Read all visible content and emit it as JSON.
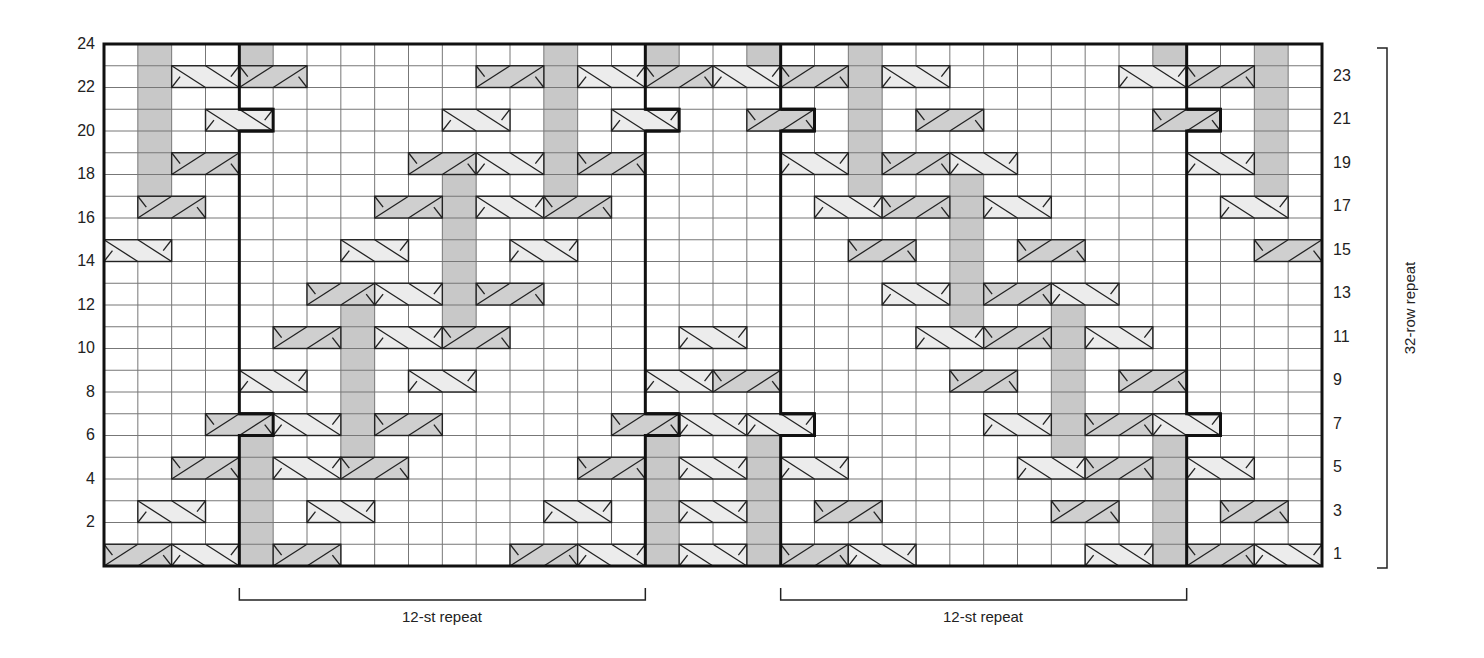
{
  "chart_data": {
    "type": "table",
    "grid": {
      "columns": 36,
      "rows": 24,
      "left": 104,
      "top": 44,
      "right": 1322,
      "bottom": 566
    },
    "colors": {
      "grid_line": "#555555",
      "outline": "#111111",
      "shade": "#c8c8c8",
      "cable_light": "#ececec",
      "cable_dark": "#cfcfcf",
      "background": "#ffffff"
    },
    "row_labels_left": [
      24,
      22,
      20,
      18,
      16,
      14,
      12,
      10,
      8,
      6,
      4,
      2
    ],
    "row_labels_right": [
      23,
      21,
      19,
      17,
      15,
      13,
      11,
      9,
      7,
      5,
      3,
      1
    ],
    "shaded_columns": [
      {
        "col": 1,
        "rows": [
          18,
          24
        ]
      },
      {
        "col": 4,
        "rows": [
          24,
          24
        ]
      },
      {
        "col": 4,
        "rows": [
          1,
          6
        ]
      },
      {
        "col": 7,
        "rows": [
          6,
          12
        ]
      },
      {
        "col": 10,
        "rows": [
          12,
          18
        ]
      },
      {
        "col": 13,
        "rows": [
          18,
          24
        ]
      },
      {
        "col": 16,
        "rows": [
          24,
          24
        ]
      },
      {
        "col": 16,
        "rows": [
          1,
          6
        ]
      },
      {
        "col": 19,
        "rows": [
          24,
          24
        ]
      },
      {
        "col": 19,
        "rows": [
          1,
          6
        ]
      },
      {
        "col": 22,
        "rows": [
          18,
          24
        ]
      },
      {
        "col": 25,
        "rows": [
          12,
          18
        ]
      },
      {
        "col": 28,
        "rows": [
          6,
          12
        ]
      },
      {
        "col": 31,
        "rows": [
          24,
          24
        ]
      },
      {
        "col": 31,
        "rows": [
          1,
          6
        ]
      },
      {
        "col": 34,
        "rows": [
          18,
          24
        ]
      }
    ],
    "cables": [
      {
        "row": 23,
        "col": 2,
        "type": "light"
      },
      {
        "row": 23,
        "col": 4,
        "type": "dark"
      },
      {
        "row": 23,
        "col": 11,
        "type": "dark"
      },
      {
        "row": 23,
        "col": 14,
        "type": "light"
      },
      {
        "row": 23,
        "col": 16,
        "type": "dark"
      },
      {
        "row": 23,
        "col": 18,
        "type": "light"
      },
      {
        "row": 23,
        "col": 20,
        "type": "dark"
      },
      {
        "row": 23,
        "col": 23,
        "type": "light"
      },
      {
        "row": 23,
        "col": 30,
        "type": "light"
      },
      {
        "row": 23,
        "col": 32,
        "type": "dark"
      },
      {
        "row": 21,
        "col": 3,
        "type": "light"
      },
      {
        "row": 21,
        "col": 10,
        "type": "light"
      },
      {
        "row": 21,
        "col": 15,
        "type": "light"
      },
      {
        "row": 21,
        "col": 19,
        "type": "dark"
      },
      {
        "row": 21,
        "col": 24,
        "type": "dark"
      },
      {
        "row": 21,
        "col": 31,
        "type": "dark"
      },
      {
        "row": 19,
        "col": 2,
        "type": "dark"
      },
      {
        "row": 19,
        "col": 9,
        "type": "dark"
      },
      {
        "row": 19,
        "col": 11,
        "type": "light"
      },
      {
        "row": 19,
        "col": 14,
        "type": "dark"
      },
      {
        "row": 19,
        "col": 20,
        "type": "light"
      },
      {
        "row": 19,
        "col": 23,
        "type": "dark"
      },
      {
        "row": 19,
        "col": 25,
        "type": "light"
      },
      {
        "row": 19,
        "col": 32,
        "type": "light"
      },
      {
        "row": 17,
        "col": 1,
        "type": "dark"
      },
      {
        "row": 17,
        "col": 8,
        "type": "dark"
      },
      {
        "row": 17,
        "col": 11,
        "type": "light"
      },
      {
        "row": 17,
        "col": 13,
        "type": "dark"
      },
      {
        "row": 17,
        "col": 21,
        "type": "light"
      },
      {
        "row": 17,
        "col": 23,
        "type": "dark"
      },
      {
        "row": 17,
        "col": 26,
        "type": "light"
      },
      {
        "row": 17,
        "col": 33,
        "type": "light"
      },
      {
        "row": 15,
        "col": 0,
        "type": "light"
      },
      {
        "row": 15,
        "col": 7,
        "type": "light"
      },
      {
        "row": 15,
        "col": 12,
        "type": "light"
      },
      {
        "row": 15,
        "col": 22,
        "type": "dark"
      },
      {
        "row": 15,
        "col": 27,
        "type": "dark"
      },
      {
        "row": 15,
        "col": 34,
        "type": "dark"
      },
      {
        "row": 13,
        "col": 6,
        "type": "dark"
      },
      {
        "row": 13,
        "col": 8,
        "type": "light"
      },
      {
        "row": 13,
        "col": 11,
        "type": "dark"
      },
      {
        "row": 13,
        "col": 23,
        "type": "light"
      },
      {
        "row": 13,
        "col": 26,
        "type": "dark"
      },
      {
        "row": 13,
        "col": 28,
        "type": "light"
      },
      {
        "row": 11,
        "col": 5,
        "type": "dark"
      },
      {
        "row": 11,
        "col": 8,
        "type": "light"
      },
      {
        "row": 11,
        "col": 10,
        "type": "dark"
      },
      {
        "row": 11,
        "col": 17,
        "type": "light"
      },
      {
        "row": 11,
        "col": 24,
        "type": "light"
      },
      {
        "row": 11,
        "col": 26,
        "type": "dark"
      },
      {
        "row": 11,
        "col": 29,
        "type": "light"
      },
      {
        "row": 9,
        "col": 4,
        "type": "light"
      },
      {
        "row": 9,
        "col": 9,
        "type": "light"
      },
      {
        "row": 9,
        "col": 16,
        "type": "light"
      },
      {
        "row": 9,
        "col": 18,
        "type": "dark"
      },
      {
        "row": 9,
        "col": 25,
        "type": "dark"
      },
      {
        "row": 9,
        "col": 30,
        "type": "dark"
      },
      {
        "row": 7,
        "col": 3,
        "type": "dark"
      },
      {
        "row": 7,
        "col": 5,
        "type": "light"
      },
      {
        "row": 7,
        "col": 8,
        "type": "dark"
      },
      {
        "row": 7,
        "col": 15,
        "type": "dark"
      },
      {
        "row": 7,
        "col": 17,
        "type": "light"
      },
      {
        "row": 7,
        "col": 19,
        "type": "light"
      },
      {
        "row": 7,
        "col": 26,
        "type": "light"
      },
      {
        "row": 7,
        "col": 29,
        "type": "dark"
      },
      {
        "row": 7,
        "col": 31,
        "type": "light"
      },
      {
        "row": 5,
        "col": 2,
        "type": "dark"
      },
      {
        "row": 5,
        "col": 5,
        "type": "light"
      },
      {
        "row": 5,
        "col": 7,
        "type": "dark"
      },
      {
        "row": 5,
        "col": 14,
        "type": "dark"
      },
      {
        "row": 5,
        "col": 17,
        "type": "light"
      },
      {
        "row": 5,
        "col": 20,
        "type": "light"
      },
      {
        "row": 5,
        "col": 27,
        "type": "light"
      },
      {
        "row": 5,
        "col": 29,
        "type": "dark"
      },
      {
        "row": 5,
        "col": 32,
        "type": "light"
      },
      {
        "row": 3,
        "col": 1,
        "type": "light"
      },
      {
        "row": 3,
        "col": 6,
        "type": "light"
      },
      {
        "row": 3,
        "col": 13,
        "type": "light"
      },
      {
        "row": 3,
        "col": 17,
        "type": "light"
      },
      {
        "row": 3,
        "col": 21,
        "type": "dark"
      },
      {
        "row": 3,
        "col": 28,
        "type": "dark"
      },
      {
        "row": 3,
        "col": 33,
        "type": "dark"
      },
      {
        "row": 1,
        "col": 0,
        "type": "dark"
      },
      {
        "row": 1,
        "col": 2,
        "type": "light"
      },
      {
        "row": 1,
        "col": 5,
        "type": "dark"
      },
      {
        "row": 1,
        "col": 12,
        "type": "dark"
      },
      {
        "row": 1,
        "col": 14,
        "type": "light"
      },
      {
        "row": 1,
        "col": 17,
        "type": "light"
      },
      {
        "row": 1,
        "col": 20,
        "type": "dark"
      },
      {
        "row": 1,
        "col": 22,
        "type": "light"
      },
      {
        "row": 1,
        "col": 29,
        "type": "light"
      },
      {
        "row": 1,
        "col": 32,
        "type": "dark"
      },
      {
        "row": 1,
        "col": 34,
        "type": "light"
      }
    ],
    "repeat_outlines": [
      {
        "left_col": 4,
        "right_col": 16,
        "shifted_rows": [
          21,
          7
        ]
      },
      {
        "left_col": 20,
        "right_col": 32,
        "shifted_rows": [
          21,
          7
        ]
      }
    ],
    "stitch_repeats": [
      {
        "label": "12-st repeat",
        "from_col": 4,
        "to_col": 16
      },
      {
        "label": "12-st repeat",
        "from_col": 20,
        "to_col": 32
      }
    ],
    "row_repeat": {
      "label": "32-row repeat",
      "from_row": 1,
      "to_row": 24
    }
  },
  "labels": {
    "stitch_repeat_1": "12-st repeat",
    "stitch_repeat_2": "12-st repeat",
    "row_repeat": "32-row repeat"
  }
}
